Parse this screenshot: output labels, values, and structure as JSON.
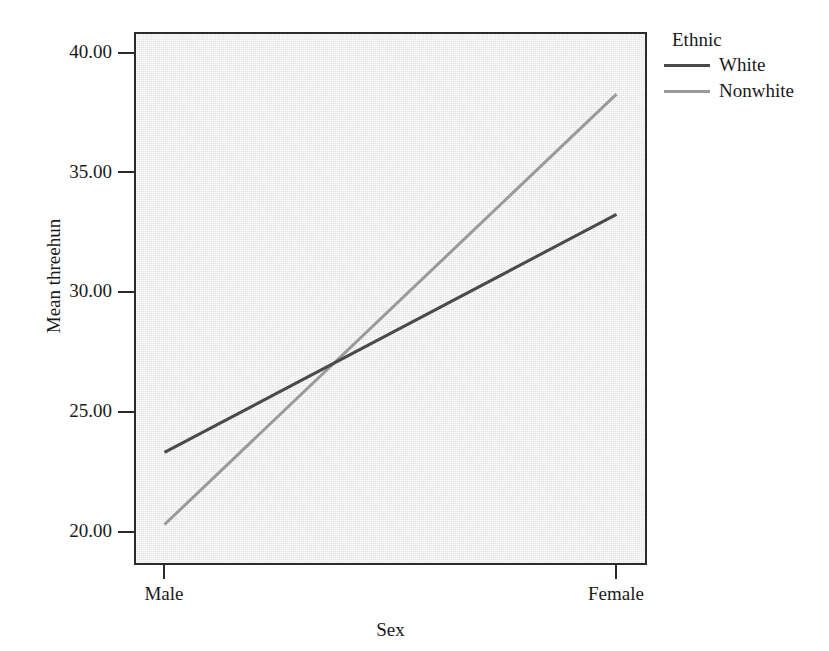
{
  "chart_data": {
    "type": "line",
    "title": "",
    "subtitle": "",
    "xlabel": "Sex",
    "ylabel": "Mean threehun",
    "categories": [
      "Male",
      "Female"
    ],
    "x": [
      0,
      1
    ],
    "series": [
      {
        "name": "White",
        "values": [
          23.6,
          33.5
        ],
        "color": "#4a4a4a"
      },
      {
        "name": "Nonwhite",
        "values": [
          20.6,
          38.5
        ],
        "color": "#9a9a9a"
      }
    ],
    "ylim": [
      19.0,
      41.0
    ],
    "yticks": [
      20.0,
      25.0,
      30.0,
      35.0,
      40.0
    ],
    "ytick_labels": [
      "20.00",
      "25.00",
      "30.00",
      "35.00",
      "40.00"
    ],
    "xtick_labels": [
      "Male",
      "Female"
    ],
    "grid": false,
    "legend": {
      "title": "Ethnic",
      "position": "right",
      "entries": [
        "White",
        "Nonwhite"
      ]
    },
    "plot_background": "#e9e9e9",
    "frame_color": "#2b2b2b"
  },
  "axes": {
    "y_title": "Mean threehun",
    "x_title": "Sex",
    "y_ticks": [
      {
        "label": "40.00",
        "value": 40.0
      },
      {
        "label": "35.00",
        "value": 35.0
      },
      {
        "label": "30.00",
        "value": 30.0
      },
      {
        "label": "25.00",
        "value": 25.0
      },
      {
        "label": "20.00",
        "value": 20.0
      }
    ],
    "x_ticks": [
      {
        "label": "Male",
        "value": 0
      },
      {
        "label": "Female",
        "value": 1
      }
    ]
  },
  "legend": {
    "title": "Ethnic",
    "items": [
      {
        "label": "White",
        "color": "#4a4a4a"
      },
      {
        "label": "Nonwhite",
        "color": "#9a9a9a"
      }
    ]
  }
}
